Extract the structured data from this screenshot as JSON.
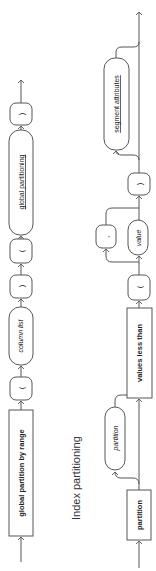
{
  "diagram1": {
    "nodes": [
      {
        "type": "keyword",
        "label": "global partition by range"
      },
      {
        "type": "punct",
        "label": "("
      },
      {
        "type": "nonterminal",
        "label": "column list"
      },
      {
        "type": "punct",
        "label": ")"
      },
      {
        "type": "punct",
        "label": "("
      },
      {
        "type": "nonterminal",
        "label": "global partitioning"
      },
      {
        "type": "punct",
        "label": ")"
      }
    ]
  },
  "section_title": "Index partitioning",
  "diagram2": {
    "nodes": [
      {
        "type": "keyword",
        "label": "partition"
      },
      {
        "type": "optional-variable",
        "label": "partition"
      },
      {
        "type": "keyword",
        "label": "values less than"
      },
      {
        "type": "punct",
        "label": "("
      },
      {
        "type": "variable",
        "label": "value"
      },
      {
        "type": "loop-separator",
        "label": ","
      },
      {
        "type": "punct",
        "label": ")"
      },
      {
        "type": "optional-nonterminal",
        "label": "segment attributes"
      }
    ]
  },
  "colors": {
    "line": "#555555",
    "text": "#222222",
    "background": "#ffffff"
  }
}
